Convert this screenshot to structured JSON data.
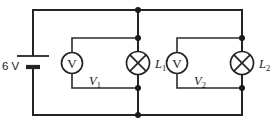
{
  "diagram": {
    "type": "electrical-circuit-schematic",
    "background_color": "#ffffff",
    "wire_color": "#242424"
  },
  "source": {
    "name": "battery",
    "symbol": "battery-cell",
    "label": "6 V",
    "voltage_value": "6",
    "voltage_unit": "V",
    "orientation": "vertical",
    "position": "left-branch"
  },
  "meters": [
    {
      "name": "voltmeter-1",
      "symbol": "circle-with-V",
      "inner_text": "V",
      "label": "V",
      "subscript": "1",
      "label_full": "V₁",
      "connected_across": "lamp-1"
    },
    {
      "name": "voltmeter-2",
      "symbol": "circle-with-V",
      "inner_text": "V",
      "label": "V",
      "subscript": "2",
      "label_full": "V₂",
      "connected_across": "lamp-2"
    }
  ],
  "lamps": [
    {
      "name": "lamp-1",
      "symbol": "circle-with-cross",
      "label": "L",
      "subscript": "1",
      "label_full": "L₁"
    },
    {
      "name": "lamp-2",
      "symbol": "circle-with-cross",
      "label": "L",
      "subscript": "2",
      "label_full": "L₂"
    }
  ],
  "junctions": {
    "count": 8,
    "description": "filled dots marking wire connection nodes"
  }
}
